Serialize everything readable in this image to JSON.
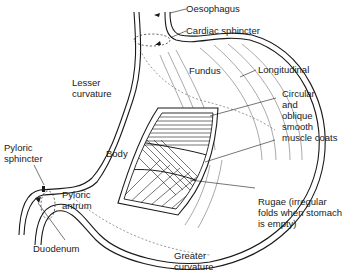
{
  "diagram": {
    "labels": {
      "oesophagus": "Oesophagus",
      "cardiac_sphincter": "Cardiac sphincter",
      "lesser_curvature": "Lesser\ncurvature",
      "fundus": "Fundus",
      "longitudinal": "Longitudinal",
      "circular_oblique": "Circular\nand\noblique\nsmooth\nmuscle coats",
      "body": "Body",
      "pyloric_sphincter": "Pyloric\nsphincter",
      "pyloric_antrum": "Pyloric\nantrum",
      "rugae": "Rugae (irregular\nfolds when stomach\nis empty)",
      "duodenum": "Duodenum",
      "greater_curvature": "Greater\ncurvature"
    },
    "colors": {
      "line": "#1a1a1a",
      "background": "#ffffff"
    }
  }
}
